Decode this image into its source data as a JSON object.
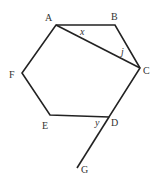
{
  "diagram": {
    "points": [
      {
        "name": "A",
        "x": 56,
        "y": 25,
        "lx": 45,
        "ly": 21
      },
      {
        "name": "B",
        "x": 115,
        "y": 25,
        "lx": 111,
        "ly": 20
      },
      {
        "name": "C",
        "x": 140,
        "y": 68,
        "lx": 143,
        "ly": 74
      },
      {
        "name": "D",
        "x": 109,
        "y": 117,
        "lx": 111,
        "ly": 126
      },
      {
        "name": "E",
        "x": 50,
        "y": 115,
        "lx": 42,
        "ly": 129
      },
      {
        "name": "F",
        "x": 22,
        "y": 73,
        "lx": 9,
        "ly": 78
      },
      {
        "name": "G",
        "x": 77,
        "y": 168,
        "lx": 81,
        "ly": 173
      }
    ],
    "angle_labels": [
      {
        "name": "x",
        "x": 80,
        "y": 35
      },
      {
        "name": "j",
        "x": 121,
        "y": 55
      },
      {
        "name": "y",
        "x": 95,
        "y": 126
      }
    ]
  }
}
